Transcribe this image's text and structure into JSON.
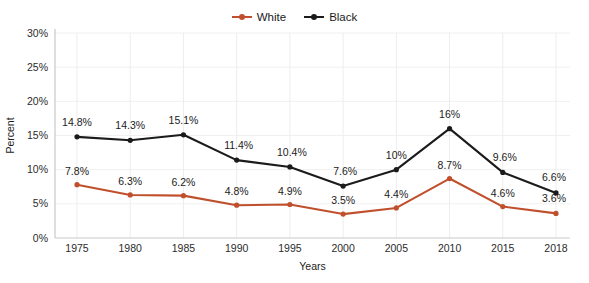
{
  "title_strip": {
    "clipped_text": ""
  },
  "legend": {
    "position": "top-center",
    "items": [
      {
        "label": "White",
        "color": "#c0502d",
        "icon": "line-marker-icon"
      },
      {
        "label": "Black",
        "color": "#1b1b1b",
        "icon": "line-marker-icon"
      }
    ]
  },
  "axes": {
    "ylabel": "Percent",
    "xlabel": "Years",
    "yticks": [
      "0%",
      "5%",
      "10%",
      "15%",
      "20%",
      "25%",
      "30%"
    ],
    "xticks": [
      "1975",
      "1980",
      "1985",
      "1990",
      "1995",
      "2000",
      "2005",
      "2010",
      "2015",
      "2018"
    ]
  },
  "chart_data": {
    "type": "line",
    "title": "",
    "xlabel": "Years",
    "ylabel": "Percent",
    "categories": [
      "1975",
      "1980",
      "1985",
      "1990",
      "1995",
      "2000",
      "2005",
      "2010",
      "2015",
      "2018"
    ],
    "x": [
      1975,
      1980,
      1985,
      1990,
      1995,
      2000,
      2005,
      2010,
      2015,
      2018
    ],
    "ylim": [
      0,
      30
    ],
    "yticks": [
      0,
      5,
      10,
      15,
      20,
      25,
      30
    ],
    "ytick_labels": [
      "0%",
      "5%",
      "10%",
      "15%",
      "20%",
      "25%",
      "30%"
    ],
    "grid": "both-faint",
    "legend_position": "top-center",
    "series": [
      {
        "name": "White",
        "color": "#c0502d",
        "values": [
          7.8,
          6.3,
          6.2,
          4.8,
          4.9,
          3.5,
          4.4,
          8.7,
          4.6,
          3.6
        ],
        "data_labels": [
          "7.8%",
          "6.3%",
          "6.2%",
          "4.8%",
          "4.9%",
          "3.5%",
          "4.4%",
          "8.7%",
          "4.6%",
          "3.6%"
        ]
      },
      {
        "name": "Black",
        "color": "#1b1b1b",
        "values": [
          14.8,
          14.3,
          15.1,
          11.4,
          10.4,
          7.6,
          10.0,
          16.0,
          9.6,
          6.6
        ],
        "data_labels": [
          "14.8%",
          "14.3%",
          "15.1%",
          "11.4%",
          "10.4%",
          "7.6%",
          "10%",
          "16%",
          "9.6%",
          "6.6%"
        ]
      }
    ]
  }
}
